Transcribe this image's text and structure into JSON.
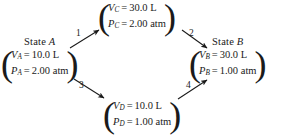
{
  "diagram": {
    "ink_color": "#1a1a1a",
    "background_color": "#ffffff"
  },
  "states": {
    "a": {
      "label_prefix": "State",
      "label_var": "A",
      "rows": [
        {
          "symbol": "V",
          "subscript": "A",
          "equals": "=",
          "value": "10.0 L"
        },
        {
          "symbol": "P",
          "subscript": "A",
          "equals": "=",
          "value": "2.00 atm"
        }
      ]
    },
    "b": {
      "label_prefix": "State",
      "label_var": "B",
      "rows": [
        {
          "symbol": "V",
          "subscript": "B",
          "equals": "=",
          "value": "30.0 L"
        },
        {
          "symbol": "P",
          "subscript": "B",
          "equals": "=",
          "value": "1.00 atm"
        }
      ]
    },
    "c": {
      "label_prefix": "",
      "label_var": "",
      "rows": [
        {
          "symbol": "V",
          "subscript": "C",
          "equals": "=",
          "value": "30.0 L"
        },
        {
          "symbol": "P",
          "subscript": "C",
          "equals": "=",
          "value": "2.00 atm"
        }
      ]
    },
    "d": {
      "label_prefix": "",
      "label_var": "",
      "rows": [
        {
          "symbol": "V",
          "subscript": "D",
          "equals": "=",
          "value": "10.0 L"
        },
        {
          "symbol": "P",
          "subscript": "D",
          "equals": "=",
          "value": "1.00 atm"
        }
      ]
    }
  },
  "paren": {
    "left": "(",
    "right": ")"
  },
  "arrows": [
    {
      "id": "1",
      "label": "1",
      "from": "a",
      "to": "c",
      "direction": "up-right"
    },
    {
      "id": "2",
      "label": "2",
      "from": "c",
      "to": "b",
      "direction": "down-right"
    },
    {
      "id": "3",
      "label": "3",
      "from": "a",
      "to": "d",
      "direction": "down-right"
    },
    {
      "id": "4",
      "label": "4",
      "from": "d",
      "to": "b",
      "direction": "up-right"
    }
  ]
}
